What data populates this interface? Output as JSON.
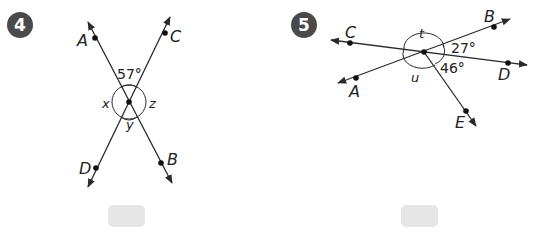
{
  "problems": [
    {
      "number": "4",
      "points": {
        "A": "A",
        "B": "B",
        "C": "C",
        "D": "D"
      },
      "angles": {
        "given": "57°",
        "x": "x",
        "y": "y",
        "z": "z"
      },
      "answer_box": {
        "value": ""
      }
    },
    {
      "number": "5",
      "points": {
        "A": "A",
        "B": "B",
        "C": "C",
        "D": "D",
        "E": "E"
      },
      "angles": {
        "given_1": "27°",
        "given_2": "46°",
        "t": "t",
        "u": "u"
      },
      "answer_box": {
        "value": ""
      }
    }
  ],
  "colors": {
    "line": "#2a2a2a",
    "badge": "#4a4a4a",
    "answer_box": "#e6e6e6"
  }
}
